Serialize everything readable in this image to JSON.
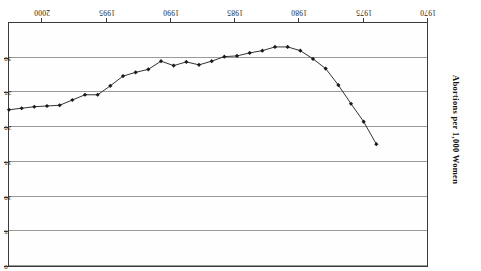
{
  "chart_data": {
    "type": "line",
    "title": "",
    "xlabel": "",
    "ylabel": "Abortions per 1,000 Women",
    "xlim": [
      1969,
      2002
    ],
    "ylim": [
      0,
      32.5
    ],
    "y_axis_inverted": true,
    "y_axis_position": "right",
    "x_axis_position": "top",
    "rotation_degrees": 180,
    "grid": "horizontal",
    "legend": "none",
    "marker": "filled-diamond",
    "line_color": "#1a1a1a",
    "grid_color": "#9a9a9a",
    "frame_color": "#3a3a3a",
    "xticks": [
      1970,
      1975,
      1980,
      1985,
      1990,
      1995,
      2000
    ],
    "xtick_labels": [
      "1970",
      "1975",
      "1980",
      "1985",
      "1990",
      "1995",
      "2000"
    ],
    "yticks": [
      0,
      5,
      10,
      15,
      20,
      25,
      30
    ],
    "ytick_labels": [
      "0",
      "5",
      "10",
      "15",
      "20",
      "25",
      "30"
    ],
    "x": [
      1973,
      1974,
      1975,
      1976,
      1977,
      1978,
      1979,
      1980,
      1981,
      1982,
      1983,
      1984,
      1985,
      1986,
      1987,
      1988,
      1989,
      1990,
      1991,
      1992,
      1993,
      1994,
      1995,
      1996,
      1997,
      1998,
      1999,
      2000,
      2001,
      2002
    ],
    "values": [
      16.3,
      19.3,
      21.7,
      24.2,
      26.4,
      27.7,
      28.8,
      29.3,
      29.3,
      28.8,
      28.5,
      28.1,
      28.0,
      27.4,
      26.9,
      27.3,
      26.8,
      27.4,
      26.3,
      25.9,
      25.4,
      24.1,
      22.9,
      22.9,
      22.2,
      21.5,
      21.4,
      21.3,
      21.1,
      20.9
    ],
    "marker_pixel_x": [
      392,
      380,
      369,
      357,
      345,
      334,
      322,
      310,
      299,
      287,
      276,
      264,
      252,
      241,
      229,
      217,
      206,
      194,
      183,
      171,
      159,
      148,
      136,
      124,
      113,
      101,
      89,
      78,
      66,
      41
    ],
    "marker_pixel_y": [
      133,
      150,
      169,
      188,
      205,
      215,
      224,
      227,
      228,
      224,
      222,
      219,
      219,
      214,
      211,
      213,
      210,
      214,
      206,
      203,
      199,
      189,
      180,
      180,
      174,
      169,
      168,
      167,
      166,
      172
    ],
    "series": [
      {
        "name": "Abortion rate",
        "values": [
          16.3,
          19.3,
          21.7,
          24.2,
          26.4,
          27.7,
          28.8,
          29.3,
          29.3,
          28.8,
          28.5,
          28.1,
          28.0,
          27.4,
          26.9,
          27.3,
          26.8,
          27.4,
          26.3,
          25.9,
          25.4,
          24.1,
          22.9,
          22.9,
          22.2,
          21.5,
          21.4,
          21.3,
          21.1,
          20.9
        ]
      }
    ]
  },
  "axis": {
    "y_title": "Abortions per 1,000 Women"
  }
}
